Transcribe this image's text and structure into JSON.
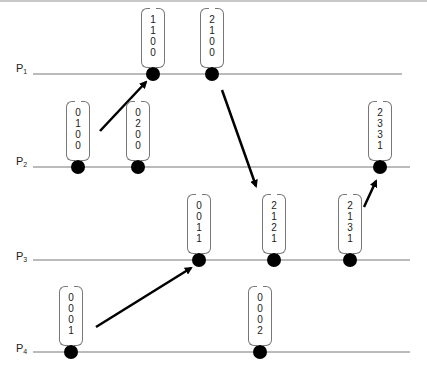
{
  "processes": [
    {
      "label": "P",
      "sub": "1",
      "y": 74,
      "label_y": 62,
      "line_x1": 33,
      "line_x2": 402,
      "events": [
        {
          "x": 153,
          "vector": [
            "1",
            "1",
            "0",
            "0"
          ]
        },
        {
          "x": 212,
          "vector": [
            "2",
            "1",
            "0",
            "0"
          ]
        }
      ]
    },
    {
      "label": "P",
      "sub": "2",
      "y": 167,
      "label_y": 155,
      "line_x1": 33,
      "line_x2": 410,
      "events": [
        {
          "x": 78,
          "vector": [
            "0",
            "1",
            "0",
            "0"
          ]
        },
        {
          "x": 138,
          "vector": [
            "0",
            "2",
            "0",
            "0"
          ]
        },
        {
          "x": 380,
          "vector": [
            "2",
            "3",
            "3",
            "1"
          ]
        }
      ]
    },
    {
      "label": "P",
      "sub": "3",
      "y": 260,
      "label_y": 250,
      "line_x1": 33,
      "line_x2": 410,
      "events": [
        {
          "x": 199,
          "vector": [
            "0",
            "0",
            "1",
            "1"
          ]
        },
        {
          "x": 274,
          "vector": [
            "2",
            "1",
            "2",
            "1"
          ]
        },
        {
          "x": 350,
          "vector": [
            "2",
            "1",
            "3",
            "1"
          ]
        }
      ]
    },
    {
      "label": "P",
      "sub": "4",
      "y": 352,
      "label_y": 342,
      "line_x1": 33,
      "line_x2": 410,
      "events": [
        {
          "x": 71,
          "vector": [
            "0",
            "0",
            "0",
            "1"
          ]
        },
        {
          "x": 260,
          "vector": [
            "0",
            "0",
            "0",
            "2"
          ]
        }
      ]
    }
  ],
  "messages": [
    {
      "from": "P2.e1",
      "to": "P1.e1",
      "x1": 100,
      "y1": 131,
      "x2": 146,
      "y2": 82
    },
    {
      "from": "P1.e2",
      "to": "P3.e2",
      "x1": 222,
      "y1": 90,
      "x2": 256,
      "y2": 186
    },
    {
      "from": "P4.e1",
      "to": "P3.e1",
      "x1": 96,
      "y1": 327,
      "x2": 191,
      "y2": 268
    },
    {
      "from": "P3.e3",
      "to": "P2.e3",
      "x1": 364,
      "y1": 207,
      "x2": 376,
      "y2": 181
    }
  ],
  "colors": {
    "line": "#777777",
    "dot": "#000000",
    "arrow": "#000000",
    "bracket": "#777777"
  }
}
